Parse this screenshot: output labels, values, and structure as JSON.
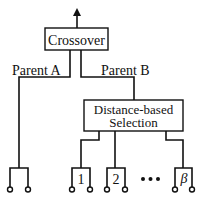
{
  "diagram": {
    "top_block": {
      "label": "Crossover"
    },
    "edges": {
      "left_label": "Parent A",
      "right_label": "Parent B"
    },
    "selection_block": {
      "line1": "Distance-based",
      "line2": "Selection"
    },
    "candidate_groups": [
      {
        "label": "1"
      },
      {
        "label": "2"
      },
      {
        "label": "β"
      }
    ],
    "ellipsis": "•••",
    "colors": {
      "stroke": "#111111",
      "background": "#ffffff"
    }
  }
}
